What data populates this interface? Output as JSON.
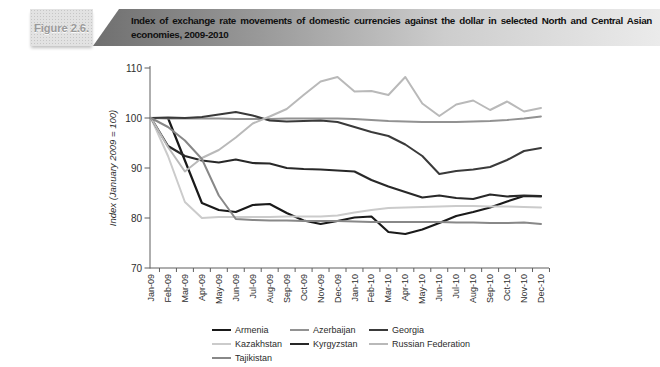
{
  "figure": {
    "label": "Figure 2.6.",
    "title": "Index of exchange rate movements of domestic currencies against the dollar in selected North and Central Asian economies, 2009-2010"
  },
  "chart_data": {
    "type": "line",
    "title": "Index of exchange rate movements of domestic currencies against the dollar in selected North and Central Asian economies, 2009-2010",
    "xlabel": "",
    "ylabel": "Index (January 2009 = 100)",
    "ylim": [
      70,
      110
    ],
    "yticks": [
      70,
      80,
      90,
      100,
      110
    ],
    "grid": false,
    "legend_position": "bottom",
    "x": [
      "Jan-09",
      "Feb-09",
      "Mar-09",
      "Apr-09",
      "May-09",
      "Jun-09",
      "Jul-09",
      "Aug-09",
      "Sep-09",
      "Oct-09",
      "Nov-09",
      "Dec-09",
      "Jan-10",
      "Feb-10",
      "Mar-10",
      "Apr-10",
      "May-10",
      "Jun-10",
      "Jul-10",
      "Aug-10",
      "Sep-10",
      "Oct-10",
      "Nov-10",
      "Dec-10"
    ],
    "series": [
      {
        "name": "Armenia",
        "color": "#1a1a1a",
        "width": 2.2,
        "values": [
          100,
          100,
          91.5,
          83.0,
          81.6,
          81.2,
          82.6,
          82.8,
          81.0,
          79.5,
          78.8,
          79.4,
          80.1,
          80.3,
          77.2,
          76.8,
          77.7,
          79.0,
          80.4,
          81.2,
          82.1,
          83.3,
          84.4,
          84.3
        ]
      },
      {
        "name": "Azerbaijan",
        "color": "#929292",
        "width": 1.8,
        "values": [
          100,
          99.9,
          99.9,
          99.9,
          99.9,
          99.8,
          99.8,
          99.8,
          99.9,
          99.9,
          99.9,
          99.9,
          99.8,
          99.6,
          99.4,
          99.3,
          99.2,
          99.2,
          99.2,
          99.3,
          99.4,
          99.6,
          99.9,
          100.3
        ]
      },
      {
        "name": "Georgia",
        "color": "#3a3a3a",
        "width": 2,
        "values": [
          100,
          100.1,
          100.0,
          100.2,
          100.7,
          101.2,
          100.5,
          99.5,
          99.3,
          99.4,
          99.5,
          99.2,
          98.2,
          97.2,
          96.4,
          94.7,
          92.4,
          88.8,
          89.4,
          89.7,
          90.2,
          91.6,
          93.4,
          94.0
        ]
      },
      {
        "name": "Kazakhstan",
        "color": "#cbcbcb",
        "width": 2,
        "values": [
          100,
          92.4,
          83.2,
          80.0,
          80.2,
          80.2,
          80.2,
          80.2,
          80.3,
          80.3,
          80.3,
          80.5,
          81.1,
          81.6,
          82.0,
          82.1,
          82.2,
          82.3,
          82.4,
          82.4,
          82.3,
          82.3,
          82.2,
          82.1
        ]
      },
      {
        "name": "Kyrgyzstan",
        "color": "#282828",
        "width": 2.2,
        "values": [
          100,
          94.4,
          92.4,
          91.5,
          91.1,
          91.7,
          91.0,
          90.9,
          90.0,
          89.8,
          89.7,
          89.5,
          89.3,
          87.6,
          86.3,
          85.2,
          84.1,
          84.5,
          84.0,
          83.8,
          84.7,
          84.3,
          84.5,
          84.4
        ]
      },
      {
        "name": "Russian Federation",
        "color": "#b9b9b9",
        "width": 2,
        "values": [
          100,
          94.2,
          89.3,
          92.0,
          93.6,
          96.1,
          98.9,
          100.3,
          101.8,
          104.6,
          107.3,
          108.2,
          105.3,
          105.4,
          104.6,
          108.2,
          102.9,
          100.4,
          102.7,
          103.5,
          101.6,
          103.3,
          101.3,
          102.0
        ]
      },
      {
        "name": "Tajikistan",
        "color": "#888888",
        "width": 2,
        "values": [
          100,
          98.2,
          95.5,
          91.8,
          84.5,
          79.8,
          79.6,
          79.5,
          79.5,
          79.4,
          79.4,
          79.4,
          79.3,
          79.2,
          79.2,
          79.2,
          79.2,
          79.2,
          79.1,
          79.1,
          79.0,
          79.0,
          79.1,
          78.8
        ]
      }
    ]
  }
}
